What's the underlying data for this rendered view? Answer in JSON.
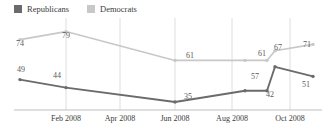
{
  "legend": {
    "position": "top-left",
    "items": [
      {
        "label": "Republicans",
        "color": "#6b6b6b",
        "icon": "square-swatch"
      },
      {
        "label": "Democrats",
        "color": "#c8c8c8",
        "icon": "square-swatch"
      }
    ]
  },
  "axis": {
    "ticks": [
      {
        "label": "Feb 2008",
        "x": 66
      },
      {
        "label": "Apr 2008",
        "x": 120
      },
      {
        "label": "Jun 2008",
        "x": 175
      },
      {
        "label": "Aug 2008",
        "x": 232
      },
      {
        "label": "Oct 2008",
        "x": 290
      }
    ]
  },
  "colors": {
    "republican_line": "#6b6b6b",
    "democrat_line": "#c8c8c8",
    "gridline": "#dedede",
    "axis": "#bfbfbf",
    "label_text": "#5a5a5a",
    "axis_text": "#3b3b3b"
  },
  "chart_data": {
    "type": "line",
    "title": "",
    "xlabel": "",
    "ylabel": "",
    "ylim": [
      30,
      85
    ],
    "grid": "vertical",
    "legend_position": "top-left",
    "categories": [
      "Jan 2008",
      "Feb 2008",
      "Jun 2008",
      "Sep 2008",
      "Oct 2008",
      "Oct 2008 b",
      "Nov 2008"
    ],
    "x": [
      20,
      66,
      175,
      245,
      267,
      275,
      313
    ],
    "series": [
      {
        "name": "Republicans",
        "color": "#6b6b6b",
        "values": [
          49,
          44,
          35,
          42,
          42,
          57,
          51
        ],
        "labels": [
          "49",
          "44",
          "35",
          "",
          "42",
          "57",
          "51"
        ]
      },
      {
        "name": "Democrats",
        "color": "#c8c8c8",
        "values": [
          74,
          79,
          61,
          61,
          61,
          67,
          71
        ],
        "labels": [
          "74",
          "79",
          "61",
          "61",
          "",
          "67",
          "71"
        ]
      }
    ],
    "point_labels": [
      {
        "series": "Democrats",
        "text": "74",
        "x": 20,
        "y": 40
      },
      {
        "series": "Democrats",
        "text": "79",
        "x": 66,
        "y": 32
      },
      {
        "series": "Democrats",
        "text": "61",
        "x": 190,
        "y": 52
      },
      {
        "series": "Democrats",
        "text": "61",
        "x": 262,
        "y": 50
      },
      {
        "series": "Democrats",
        "text": "67",
        "x": 278,
        "y": 44
      },
      {
        "series": "Democrats",
        "text": "71",
        "x": 307,
        "y": 41
      },
      {
        "series": "Republicans",
        "text": "49",
        "x": 21,
        "y": 66
      },
      {
        "series": "Republicans",
        "text": "44",
        "x": 57,
        "y": 72
      },
      {
        "series": "Republicans",
        "text": "35",
        "x": 188,
        "y": 93
      },
      {
        "series": "Republicans",
        "text": "57",
        "x": 255,
        "y": 73
      },
      {
        "series": "Republicans",
        "text": "42",
        "x": 270,
        "y": 91
      },
      {
        "series": "Republicans",
        "text": "51",
        "x": 306,
        "y": 81
      }
    ]
  }
}
